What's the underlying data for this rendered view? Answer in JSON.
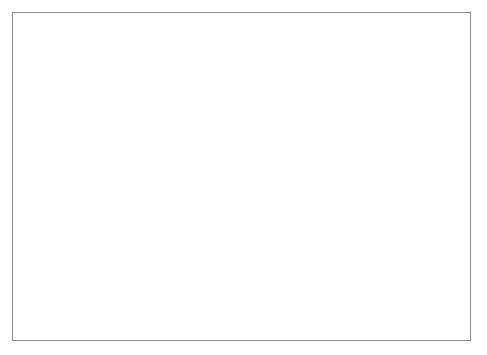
{
  "chart_data": {
    "type": "area",
    "title": "",
    "subtitle": "",
    "xlabel": "",
    "ylabel": "Employment (Thousands)",
    "stacked": true,
    "grid": true,
    "legend_position": "inline-labels",
    "x": [
      1990,
      1991,
      1992,
      1993,
      1994,
      1995,
      1996,
      1997,
      1998,
      1999,
      2000,
      2001,
      2002
    ],
    "xlim": [
      1990,
      2002
    ],
    "ylim": [
      0,
      1200
    ],
    "xticks": [
      1990,
      1992,
      1994,
      1996,
      1998,
      2000,
      2002
    ],
    "xtick_labels": [
      "1990",
      "1992",
      "1994",
      "1996",
      "1998",
      "2000",
      "2002"
    ],
    "xminorticks": [
      1991,
      1993,
      1995,
      1997,
      1999,
      2001
    ],
    "yticks": [
      0,
      200,
      400,
      600,
      800,
      1000,
      1200
    ],
    "ytick_labels": [
      "0",
      "200",
      "400",
      "600",
      "800",
      "1000",
      "1200"
    ],
    "series": [
      {
        "name": "Manufacturing",
        "label_x": 1996.0,
        "label_y": 290,
        "fill": "#b5b5b5",
        "line": "#1a1a1a",
        "values": [
          440,
          437,
          425,
          400,
          368,
          385,
          405,
          415,
          418,
          405,
          418,
          412,
          345
        ]
      },
      {
        "name": "Services",
        "label_x": 1994.3,
        "label_y": 560,
        "fill": "#c4c4c4",
        "line": "#1a1a1a",
        "cumulative_top": [
          775,
          770,
          745,
          720,
          707,
          710,
          740,
          790,
          830,
          870,
          1005,
          990,
          860
        ],
        "values": [
          335,
          333,
          320,
          320,
          339,
          325,
          335,
          375,
          412,
          465,
          587,
          578,
          515
        ]
      }
    ],
    "plot_background": "#e9e9e9",
    "gridline_color": "#777777",
    "plot_border_color": "#4a4a4a",
    "frame_border_color": "#8c8c8c",
    "page_background": "#ffffff"
  }
}
